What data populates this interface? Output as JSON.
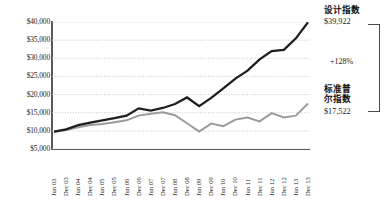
{
  "chart_data": {
    "type": "line",
    "title": "",
    "subtitle": "",
    "xlabel": "",
    "ylabel": "",
    "ylim": [
      5000,
      40000
    ],
    "y_ticks": [
      40000,
      35000,
      30000,
      25000,
      20000,
      15000,
      10000,
      5000
    ],
    "y_tick_labels": [
      "$40,000",
      "$35,000",
      "$30,000",
      "$25,000",
      "$20,000",
      "$15,000",
      "$10,000",
      "$5,000"
    ],
    "grid": true,
    "grid_style": "dotted-horizontal",
    "legend_position": "right-annotations",
    "categories": [
      "Jun 03",
      "Dec 03",
      "Jun 04",
      "Dec 04",
      "Jun 05",
      "Dec 05",
      "Jun 06",
      "Dec 06",
      "Jun 07",
      "Dec 07",
      "Jun 08",
      "Dec 08",
      "Jun 09",
      "Dec 09",
      "Jun 10",
      "Dec 10",
      "Jun 11",
      "Dec 11",
      "Jun 12",
      "Dec 12",
      "Jun 13",
      "Dec 13"
    ],
    "series": [
      {
        "name": "设计指数",
        "color": "#1f1f1f",
        "end_value": 39922,
        "end_label": "$39,922",
        "values": [
          9800,
          10400,
          11600,
          12300,
          12900,
          13500,
          14200,
          16200,
          15600,
          16300,
          17400,
          19200,
          16800,
          19100,
          21700,
          24400,
          26600,
          29700,
          32000,
          32300,
          35500,
          39922
        ]
      },
      {
        "name": "标准普尔指数",
        "color": "#9b9b9b",
        "end_value": 17522,
        "end_label": "$17,522",
        "values": [
          9700,
          10200,
          11000,
          11600,
          11900,
          12400,
          12900,
          14200,
          14700,
          15100,
          14300,
          12100,
          9800,
          12000,
          11300,
          13100,
          13700,
          12600,
          14900,
          13700,
          14200,
          17522
        ]
      }
    ],
    "annotations": [
      {
        "name": "design-index",
        "label": "设计指数",
        "value": "$39,922"
      },
      {
        "name": "sp-index",
        "label": "标准普尔指数",
        "value": "$17,522"
      },
      {
        "name": "delta",
        "label": "+128%"
      }
    ]
  },
  "annotations": {
    "design_label": "设计指数",
    "design_value": "$39,922",
    "sp_label": "标准普尔指数",
    "sp_value": "$17,522",
    "delta": "+128%"
  },
  "colors": {
    "design_line": "#1f1f1f",
    "sp_line": "#9b9b9b",
    "axis": "#5a5a5a",
    "grid": "#b9b9b9",
    "text": "#1b1b1b",
    "background": "#ffffff"
  }
}
